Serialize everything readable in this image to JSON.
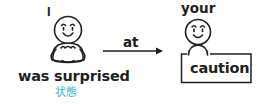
{
  "diagram": {
    "subject": {
      "label": "I",
      "figure": "seated-person-surprised"
    },
    "verb_phrase": {
      "label": "was surprised",
      "annotation": "状態",
      "annotation_color": "#3cb4c8"
    },
    "relation": {
      "label": "at",
      "arrow_direction": "right"
    },
    "object": {
      "owner_label": "your",
      "figure": "person-behind-box",
      "label": "caution"
    },
    "colors": {
      "ink": "#231f20",
      "accent": "#3cb4c8",
      "background": "#ffffff"
    }
  }
}
